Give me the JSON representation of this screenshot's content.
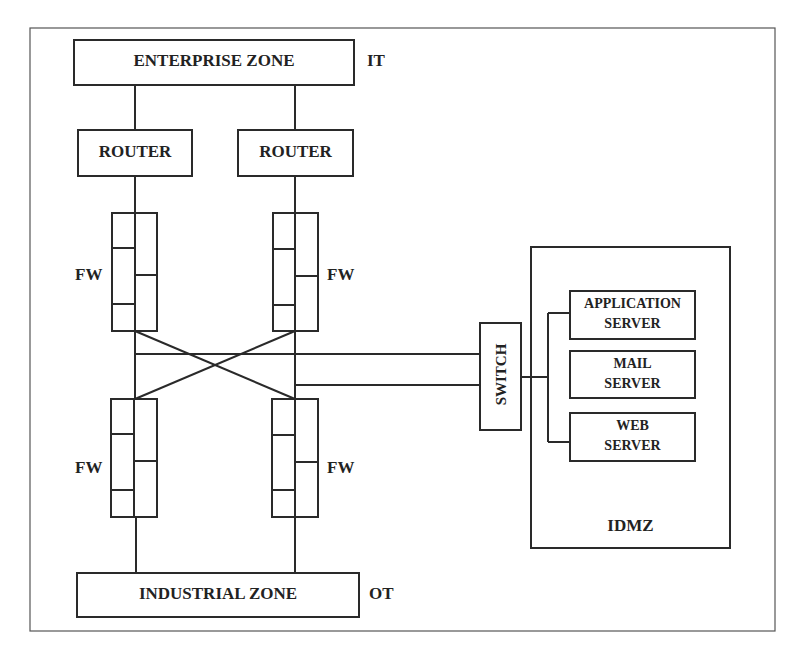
{
  "diagram": {
    "zones": {
      "enterprise": {
        "label": "ENTERPRISE ZONE",
        "tag": "IT"
      },
      "industrial": {
        "label": "INDUSTRIAL ZONE",
        "tag": "OT"
      },
      "idmz": {
        "label": "IDMZ"
      }
    },
    "routers": [
      {
        "label": "ROUTER"
      },
      {
        "label": "ROUTER"
      }
    ],
    "firewalls": [
      {
        "label": "FW",
        "position": "upper-left"
      },
      {
        "label": "FW",
        "position": "upper-right"
      },
      {
        "label": "FW",
        "position": "lower-left"
      },
      {
        "label": "FW",
        "position": "lower-right"
      }
    ],
    "switch": {
      "label": "SWITCH"
    },
    "servers": [
      {
        "line1": "APPLICATION",
        "line2": "SERVER"
      },
      {
        "line1": "MAIL",
        "line2": "SERVER"
      },
      {
        "line1": "WEB",
        "line2": "SERVER"
      }
    ],
    "colors": {
      "stroke": "#2a2a2a",
      "frame": "#555555",
      "background": "#ffffff"
    }
  }
}
